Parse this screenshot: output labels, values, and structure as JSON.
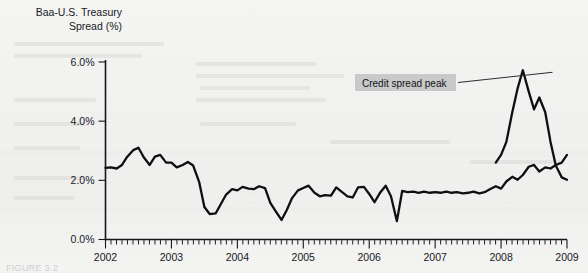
{
  "figure": {
    "y_axis_title_line1": "Baa-U.S. Treasury",
    "y_axis_title_line2": "Spread (%)",
    "caption": "FIGURE 3.2"
  },
  "annotation": {
    "label": "Credit spread peak",
    "box_color": "#c9c9c9",
    "text_color": "#101215"
  },
  "colors": {
    "line": "#0d0f12",
    "axis": "#15171a",
    "background": "#f3f3f2"
  },
  "chart_data": {
    "type": "line",
    "title": "Baa-U.S. Treasury Spread (%)",
    "xlabel": "",
    "ylabel": "Baa-U.S. Treasury Spread (%)",
    "xlim": [
      2002.0,
      2009.0
    ],
    "ylim": [
      0.0,
      6.0
    ],
    "grid": false,
    "legend": null,
    "y_ticks": [
      0.0,
      2.0,
      4.0,
      6.0
    ],
    "y_tick_labels": [
      "0.0%",
      "2.0%",
      "4.0%",
      "6.0%"
    ],
    "x_ticks": [
      2002,
      2003,
      2004,
      2005,
      2006,
      2007,
      2008,
      2009
    ],
    "x_tick_labels": [
      "2002",
      "2003",
      "2004",
      "2005",
      "2006",
      "2007",
      "2008",
      "2009"
    ],
    "x_minor_tick_interval_months": 1,
    "annotations": [
      {
        "text": "Credit spread peak",
        "points_to_x": 2008.78,
        "points_to_y": 5.72
      }
    ],
    "series": [
      {
        "name": "Baa-U.S. Treasury Spread",
        "x": [
          2002.0,
          2002.08,
          2002.17,
          2002.25,
          2002.33,
          2002.42,
          2002.5,
          2002.58,
          2002.67,
          2002.75,
          2002.83,
          2002.92,
          2003.0,
          2003.08,
          2003.17,
          2003.25,
          2003.33,
          2003.42,
          2003.5,
          2003.58,
          2003.67,
          2003.75,
          2003.83,
          2003.92,
          2004.0,
          2004.08,
          2004.17,
          2004.25,
          2004.33,
          2004.42,
          2004.5,
          2004.58,
          2004.67,
          2004.75,
          2004.83,
          2004.92,
          2005.0,
          2005.08,
          2005.17,
          2005.25,
          2005.33,
          2005.42,
          2005.5,
          2005.58,
          2005.67,
          2005.75,
          2005.83,
          2005.92,
          2006.0,
          2006.08,
          2006.17,
          2006.25,
          2006.33,
          2006.42,
          2006.5,
          2006.58,
          2006.67,
          2006.75,
          2006.83,
          2006.92,
          2007.0,
          2007.08,
          2007.17,
          2007.25,
          2007.33,
          2007.42,
          2007.5,
          2007.58,
          2007.67,
          2007.75,
          2007.83,
          2007.92,
          2008.0,
          2008.08,
          2008.17,
          2008.25,
          2008.33,
          2008.42,
          2008.5,
          2008.58,
          2008.67,
          2008.75,
          2008.83,
          2008.92,
          2009.0
        ],
        "values": [
          2.42,
          2.44,
          2.4,
          2.52,
          2.8,
          3.02,
          3.1,
          2.78,
          2.52,
          2.8,
          2.86,
          2.6,
          2.6,
          2.44,
          2.52,
          2.62,
          2.5,
          1.95,
          1.1,
          0.86,
          0.88,
          1.2,
          1.52,
          1.7,
          1.66,
          1.78,
          1.72,
          1.7,
          1.8,
          1.74,
          1.24,
          0.96,
          0.66,
          1.0,
          1.4,
          1.66,
          1.74,
          1.82,
          1.58,
          1.46,
          1.5,
          1.48,
          1.76,
          1.62,
          1.46,
          1.42,
          1.76,
          1.78,
          1.54,
          1.26,
          1.6,
          1.82,
          1.46,
          0.62,
          1.64,
          1.6,
          1.62,
          1.58,
          1.62,
          1.58,
          1.6,
          1.58,
          1.62,
          1.58,
          1.6,
          1.56,
          1.58,
          1.62,
          1.56,
          1.6,
          1.7,
          1.8,
          1.72,
          1.96,
          2.12,
          2.02,
          2.18,
          2.46,
          2.52,
          2.3,
          2.44,
          2.4,
          2.52,
          2.6,
          2.86
        ]
      },
      {
        "name": "Baa-U.S. Treasury Spread (crisis)",
        "x": [
          2007.92,
          2008.0,
          2008.08,
          2008.17,
          2008.25,
          2008.33,
          2008.42,
          2008.5,
          2008.58,
          2008.67,
          2008.75,
          2008.83,
          2008.92,
          2009.0
        ],
        "values": [
          2.6,
          2.86,
          3.3,
          4.3,
          5.1,
          5.72,
          5.0,
          4.4,
          4.8,
          4.3,
          3.3,
          2.5,
          2.1,
          2.02
        ]
      }
    ]
  }
}
